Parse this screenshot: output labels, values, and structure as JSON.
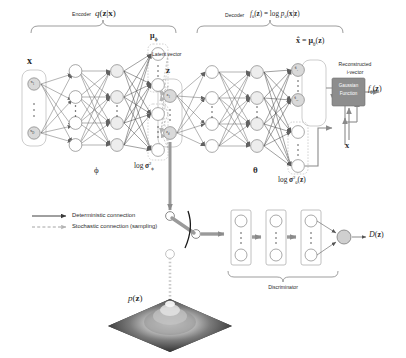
{
  "figure": {
    "background_color": "#ffffff",
    "ink_color": "#231f20",
    "node_fill": "#ffffff",
    "node_stroke": "#6e6e6e",
    "group_box_stroke": "#b9b9b9",
    "dashed_color": "#b0b0b0",
    "arrow_gray": "#8a8a8a",
    "gaussian_box_fill": "#8d8d8d"
  },
  "encoder": {
    "bracket_label": "Encoder",
    "formula": "q(z|x)",
    "formula_plain": "q( z | x )",
    "params_label": "ϕ",
    "input_label": "x",
    "input_nodes": [
      "x₁",
      "x_D"
    ],
    "hidden_layers": 2,
    "hidden_nodes_visible": 4,
    "mu_label": "μ",
    "mu_sub": "ϕ",
    "logvar_label": "log σ",
    "logvar_sup": "2",
    "logvar_sub": "ϕ"
  },
  "latent": {
    "caption": "Latent vector",
    "symbol": "z",
    "nodes": [
      "z₁",
      "z_d"
    ]
  },
  "decoder": {
    "bracket_label": "Decoder",
    "formula": "fθ(z) = log pθ(x|z)",
    "formula_parts": {
      "f": "f",
      "theta": "θ",
      "arg": "(z)",
      "equals": "=",
      "log": "log",
      "p": "p",
      "cond": "(x|z)"
    },
    "params_label": "θ",
    "hidden_layers": 2,
    "hidden_nodes_visible": 4,
    "output_label": "x̂ = μθ(z)",
    "output_nodes": [
      "x̂₁",
      "x̂_D"
    ],
    "reconstructed_caption_line1": "Reconstructed",
    "reconstructed_caption_line2": "i-vector",
    "logvar_label": "log σ",
    "logvar_sup": "2",
    "logvar_sub": "θ",
    "logvar_arg": "(z)"
  },
  "gaussian": {
    "box_line1": "Gaussian",
    "box_line2": "Function",
    "output_label": "fθ(z)",
    "input_label": "x"
  },
  "legend": {
    "items": [
      {
        "id": "deterministic",
        "style": "solid",
        "label": "Deterministic connection"
      },
      {
        "id": "stochastic",
        "style": "dashed",
        "label": "Stochastic connection (sampling)"
      }
    ]
  },
  "discriminator": {
    "bracket_label": "Discriminator",
    "layers": 3,
    "nodes_per_layer_visible": 2,
    "output_label": "D(z)"
  },
  "prior": {
    "label": "p(z)",
    "description": "3D Gaussian surface plot"
  },
  "switch": {
    "name": "selector-switch",
    "description": "Toggle between posterior sample z and prior sample p(z)"
  }
}
